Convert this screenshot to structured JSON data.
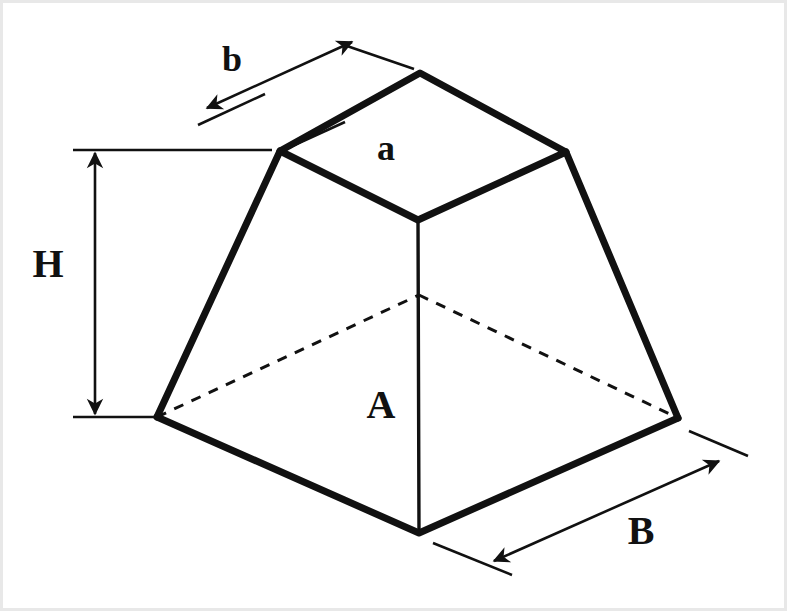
{
  "figure": {
    "background_color": "#ffffff",
    "line_color": "#111111",
    "labels": {
      "top_face": "a",
      "top_edge": "b",
      "base_face": "A",
      "base_edge": "B",
      "height": "H"
    },
    "geometry": {
      "top_face_vertices": [
        [
          280,
          151
        ],
        [
          420,
          73
        ],
        [
          566,
          152
        ],
        [
          418,
          220
        ]
      ],
      "base_face_vertices": [
        [
          157,
          417
        ],
        [
          419,
          295
        ],
        [
          678,
          418
        ],
        [
          419,
          533
        ]
      ],
      "vertical_front_edge": [
        [
          418,
          220
        ],
        [
          419,
          533
        ]
      ],
      "lateral_edges": [
        [
          [
            280,
            151
          ],
          [
            157,
            417
          ]
        ],
        [
          [
            566,
            152
          ],
          [
            678,
            418
          ]
        ]
      ],
      "hidden_edges": [
        [
          [
            157,
            417
          ],
          [
            419,
            295
          ]
        ],
        [
          [
            419,
            295
          ],
          [
            678,
            418
          ]
        ],
        [
          [
            419,
            295
          ],
          [
            418,
            220
          ]
        ]
      ]
    },
    "dimensions": [
      {
        "name": "b",
        "label": "b",
        "label_pos": [
          232,
          63
        ],
        "line": [
          [
            205,
            109
          ],
          [
            356,
            41
          ]
        ],
        "extensions": [
          [
            [
              198,
              125
            ],
            [
              262,
              95
            ]
          ],
          [
            [
              345,
              52
            ],
            [
              412,
              66
            ]
          ]
        ],
        "arrows": "both"
      },
      {
        "name": "H",
        "label": "H",
        "label_pos": [
          48,
          268
        ],
        "line": [
          [
            95,
            152
          ],
          [
            95,
            416
          ]
        ],
        "extensions": [
          [
            [
              73,
              150
            ],
            [
              272,
              150
            ]
          ],
          [
            [
              73,
              417
            ],
            [
              157,
              417
            ]
          ]
        ],
        "arrows": "both"
      },
      {
        "name": "B",
        "label": "B",
        "label_pos": [
          641,
          535
        ],
        "line": [
          [
            491,
            563
          ],
          [
            722,
            460
          ]
        ],
        "extensions": [
          [
            [
              433,
              543
            ],
            [
              510,
              573
            ]
          ],
          [
            [
              690,
              432
            ],
            [
              746,
              455
            ]
          ]
        ],
        "arrows": "both"
      }
    ]
  }
}
